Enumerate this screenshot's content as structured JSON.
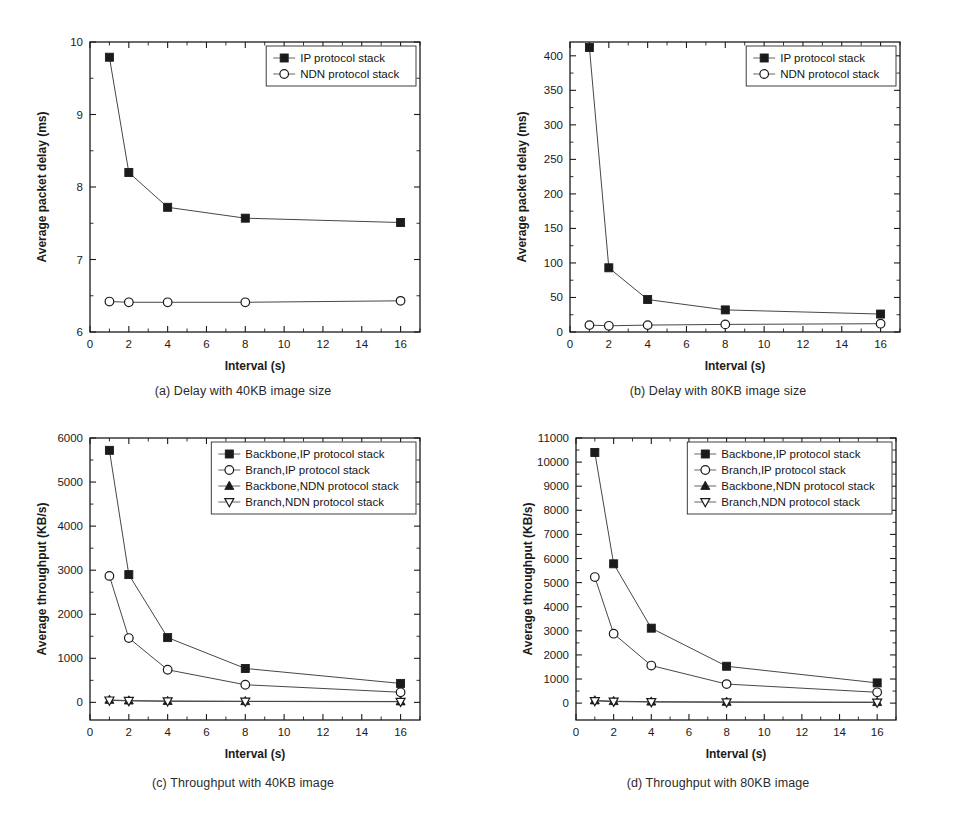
{
  "figure": {
    "panels": [
      {
        "id": "a",
        "caption": "(a) Delay with 40KB image size",
        "chart_data": {
          "type": "line",
          "title": "",
          "xlabel": "Interval (s)",
          "ylabel": "Average packet delay (ms)",
          "xlim": [
            0,
            17
          ],
          "ylim": [
            6,
            10
          ],
          "xticks": [
            0,
            2,
            4,
            6,
            8,
            10,
            12,
            14,
            16
          ],
          "yticks": [
            6,
            7,
            8,
            9,
            10
          ],
          "grid": false,
          "legend_position": "top-right",
          "x": [
            1,
            2,
            4,
            8,
            16
          ],
          "series": [
            {
              "name": "IP protocol stack",
              "marker": "filled-square",
              "values": [
                9.79,
                8.2,
                7.72,
                7.57,
                7.51
              ]
            },
            {
              "name": "NDN protocol stack",
              "marker": "open-circle",
              "values": [
                6.42,
                6.41,
                6.41,
                6.41,
                6.43
              ]
            }
          ]
        }
      },
      {
        "id": "b",
        "caption": "(b) Delay with 80KB image size",
        "chart_data": {
          "type": "line",
          "title": "",
          "xlabel": "Interval (s)",
          "ylabel": "Average packet delay (ms)",
          "xlim": [
            0,
            17
          ],
          "ylim": [
            0,
            420
          ],
          "xticks": [
            0,
            2,
            4,
            6,
            8,
            10,
            12,
            14,
            16
          ],
          "yticks": [
            0,
            50,
            100,
            150,
            200,
            250,
            300,
            350,
            400
          ],
          "grid": false,
          "legend_position": "top-right",
          "x": [
            1,
            2,
            4,
            8,
            16
          ],
          "series": [
            {
              "name": "IP protocol stack",
              "marker": "filled-square",
              "values": [
                412,
                93,
                47,
                32,
                26
              ]
            },
            {
              "name": "NDN protocol stack",
              "marker": "open-circle",
              "values": [
                10,
                9,
                10,
                11,
                12
              ]
            }
          ]
        }
      },
      {
        "id": "c",
        "caption": "(c) Throughput with 40KB image",
        "chart_data": {
          "type": "line",
          "title": "",
          "xlabel": "Interval (s)",
          "ylabel": "Average throughput (KB/s)",
          "xlim": [
            0,
            17
          ],
          "ylim": [
            -400,
            6000
          ],
          "xticks": [
            0,
            2,
            4,
            6,
            8,
            10,
            12,
            14,
            16
          ],
          "yticks": [
            0,
            1000,
            2000,
            3000,
            4000,
            5000,
            6000
          ],
          "grid": false,
          "legend_position": "top-right",
          "x": [
            1,
            2,
            4,
            8,
            16
          ],
          "series": [
            {
              "name": "Backbone,IP protocol stack",
              "marker": "filled-square",
              "values": [
                5720,
                2900,
                1470,
                770,
                430
              ]
            },
            {
              "name": "Branch,IP protocol stack",
              "marker": "open-circle",
              "values": [
                2870,
                1460,
                740,
                400,
                230
              ]
            },
            {
              "name": "Backbone,NDN protocol stack",
              "marker": "filled-triangle-up",
              "values": [
                55,
                40,
                30,
                25,
                20
              ]
            },
            {
              "name": "Branch,NDN protocol stack",
              "marker": "open-triangle-down",
              "values": [
                45,
                35,
                25,
                20,
                15
              ]
            }
          ]
        }
      },
      {
        "id": "d",
        "caption": "(d) Throughput with 80KB image",
        "chart_data": {
          "type": "line",
          "title": "",
          "xlabel": "Interval (s)",
          "ylabel": "Average throughput (KB/s)",
          "xlim": [
            0,
            17
          ],
          "ylim": [
            -700,
            11000
          ],
          "xticks": [
            0,
            2,
            4,
            6,
            8,
            10,
            12,
            14,
            16
          ],
          "yticks": [
            0,
            1000,
            2000,
            3000,
            4000,
            5000,
            6000,
            7000,
            8000,
            9000,
            10000,
            11000
          ],
          "grid": false,
          "legend_position": "top-right",
          "x": [
            1,
            2,
            4,
            8,
            16
          ],
          "series": [
            {
              "name": "Backbone,IP protocol stack",
              "marker": "filled-square",
              "values": [
                10400,
                5780,
                3110,
                1530,
                840
              ]
            },
            {
              "name": "Branch,IP protocol stack",
              "marker": "open-circle",
              "values": [
                5230,
                2880,
                1560,
                790,
                450
              ]
            },
            {
              "name": "Backbone,NDN protocol stack",
              "marker": "filled-triangle-up",
              "values": [
                110,
                80,
                60,
                50,
                40
              ]
            },
            {
              "name": "Branch,NDN protocol stack",
              "marker": "open-triangle-down",
              "values": [
                90,
                65,
                45,
                35,
                28
              ]
            }
          ]
        }
      }
    ]
  }
}
